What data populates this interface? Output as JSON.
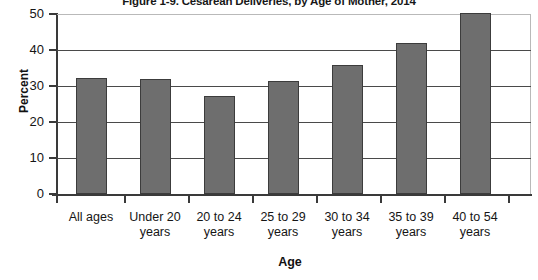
{
  "chart_data": {
    "type": "bar",
    "title": "Figure 1-9. Cesarean Deliveries, by Age of Mother, 2014",
    "xlabel": "Age",
    "ylabel": "Percent",
    "categories": [
      "All ages",
      "Under 20 years",
      "20 to 24 years",
      "25 to 29 years",
      "30 to 34 years",
      "35 to 39 years",
      "40 to 54 years"
    ],
    "category_lines": [
      [
        "All ages"
      ],
      [
        "Under 20",
        "years"
      ],
      [
        "20 to 24",
        "years"
      ],
      [
        "25 to 29",
        "years"
      ],
      [
        "30 to 34",
        "years"
      ],
      [
        "35 to 39",
        "years"
      ],
      [
        "40 to 54",
        "years"
      ]
    ],
    "values": [
      32.2,
      32.0,
      27.2,
      31.5,
      35.7,
      42.0,
      50.2
    ],
    "ylim": [
      0,
      50
    ],
    "yticks": [
      0,
      10,
      20,
      30,
      40,
      50
    ],
    "ytick_labels": [
      "0",
      "10",
      "20",
      "30",
      "40",
      "50"
    ],
    "grid": true,
    "legend": "none",
    "series_color": "#6e6e6e",
    "series_border_color": "#3c3c3c"
  }
}
